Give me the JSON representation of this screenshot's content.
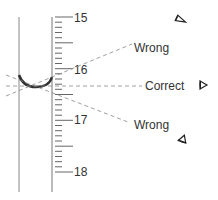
{
  "diagram": {
    "scale": {
      "labels": [
        "15",
        "16",
        "17",
        "18"
      ],
      "major_values": [
        15,
        16,
        17,
        18
      ],
      "minor_ticks_per_unit": 10
    },
    "meniscus_reading": "16.3",
    "sightlines": [
      {
        "label": "Wrong",
        "position": "above",
        "eye_icon": "eye-above-icon"
      },
      {
        "label": "Correct",
        "position": "level",
        "eye_icon": "eye-level-icon"
      },
      {
        "label": "Wrong",
        "position": "below",
        "eye_icon": "eye-below-icon"
      }
    ],
    "colors": {
      "tube": "#777777",
      "ticks": "#666666",
      "meniscus": "#333333",
      "dashes": "#888888",
      "text": "#333333"
    }
  }
}
